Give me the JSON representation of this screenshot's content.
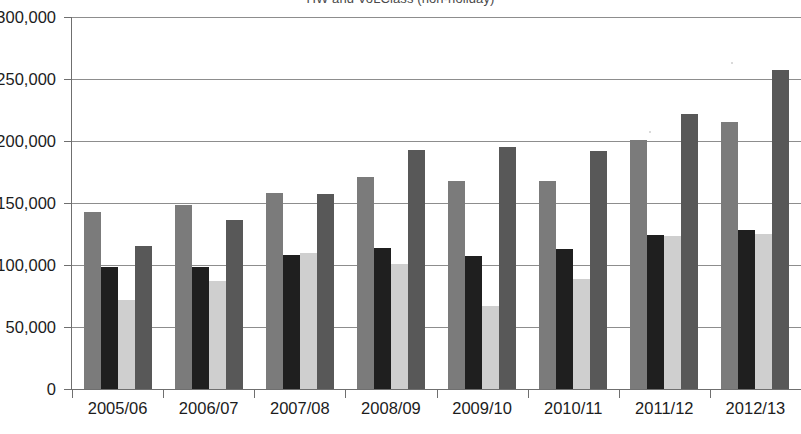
{
  "chart_data": {
    "type": "bar",
    "title": "HW and VoLClass (non-holiday)",
    "xlabel": "",
    "ylabel": "",
    "ylim": [
      0,
      300000
    ],
    "ytick_values": [
      0,
      50000,
      100000,
      150000,
      200000,
      250000,
      300000
    ],
    "ytick_labels": [
      "0",
      "50,000",
      "100,000",
      "150,000",
      "200,000",
      "250,000",
      "300,000"
    ],
    "grid": true,
    "legend": "none",
    "categories": [
      "2005/06",
      "2006/07",
      "2007/08",
      "2008/09",
      "2009/10",
      "2010/11",
      "2011/12",
      "2012/13"
    ],
    "series": [
      {
        "name": "series-1",
        "color": "#7b7b7b",
        "values": [
          143000,
          148000,
          158000,
          171000,
          168000,
          168000,
          201000,
          215000
        ]
      },
      {
        "name": "series-2",
        "color": "#1f1f1f",
        "values": [
          98000,
          98000,
          108000,
          114000,
          107000,
          113000,
          124000,
          128000
        ]
      },
      {
        "name": "series-3",
        "color": "#cfcfcf",
        "values": [
          72000,
          87000,
          110000,
          101000,
          67000,
          89000,
          123000,
          125000
        ]
      },
      {
        "name": "series-4",
        "color": "#585858",
        "values": [
          115000,
          136000,
          157000,
          193000,
          195000,
          192000,
          222000,
          257000
        ]
      }
    ]
  }
}
